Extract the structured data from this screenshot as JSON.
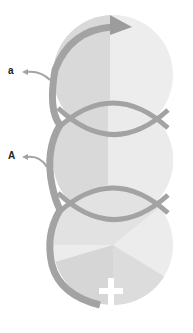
{
  "diagram": {
    "type": "three stacked overlapping circles with continuous looping arrow",
    "labels": [
      {
        "id": "label-a",
        "text": "a"
      },
      {
        "id": "label-A",
        "text": "A"
      }
    ],
    "colors": {
      "background": "#ffffff",
      "circle_light": "#ececec",
      "circle_mid": "#dcdcdc",
      "circle_dark_segment": "#d2d2d2",
      "arrow_stroke": "#a3a3a3",
      "cross": "#ffffff",
      "label": "#222222"
    },
    "circles": [
      {
        "name": "top",
        "cx": 113,
        "cy": 75,
        "r": 62
      },
      {
        "name": "middle",
        "cx": 113,
        "cy": 160,
        "r": 62
      },
      {
        "name": "bottom",
        "cx": 113,
        "cy": 245,
        "r": 62
      }
    ],
    "symbols": [
      {
        "name": "cross",
        "x": 105,
        "y": 300
      }
    ]
  }
}
